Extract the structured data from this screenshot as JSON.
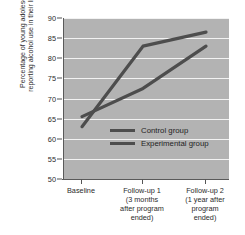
{
  "chart_data": {
    "type": "line",
    "title": "",
    "xlabel": "",
    "ylabel": "Percentage of young adolescents reporting alcohol use in their lifetime",
    "ylabel_lines": [
      "Percentage of young adolescents",
      "reporting alcohol use in their lifetime"
    ],
    "categories": [
      "Baseline",
      "Follow-up 1",
      "Follow-up 2"
    ],
    "category_labels": [
      [
        "Baseline"
      ],
      [
        "Follow-up 1",
        "(3 months",
        "after program",
        "ended)"
      ],
      [
        "Follow-up 2",
        "(1 year after",
        "program",
        "ended)"
      ]
    ],
    "series": [
      {
        "name": "Control group",
        "values": [
          63,
          83,
          86.5
        ],
        "color": "#4d4d4d"
      },
      {
        "name": "Experimental group",
        "values": [
          65.5,
          72.5,
          83
        ],
        "color": "#4d4d4d"
      }
    ],
    "ylim": [
      50,
      90
    ],
    "yticks": [
      50,
      55,
      60,
      65,
      70,
      75,
      80,
      85,
      90
    ],
    "ytick_labels": [
      "50",
      "55",
      "60",
      "65",
      "70",
      "75",
      "80",
      "85",
      "90"
    ],
    "grid": true,
    "grid_color": "#f2f2f2",
    "plot_background": "#b3b3b3",
    "legend_position": "inside-center",
    "legend": [
      "Control group",
      "Experimental group"
    ]
  }
}
